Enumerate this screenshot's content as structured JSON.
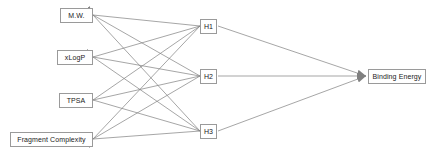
{
  "diagram": {
    "type": "feedforward-neural-network",
    "background_color": "#ffffff",
    "edge_color": "#808080",
    "node_border_color": "#9a9a9a",
    "node_fill_color": "#ffffff",
    "text_color": "#1a1a1a",
    "width": 431,
    "height": 154
  },
  "layers": {
    "input": {
      "name": "input-layer",
      "nodes": [
        {
          "id": "mw",
          "label": "M.W.",
          "x": 60,
          "y": 8,
          "w": 33,
          "h": 15
        },
        {
          "id": "xlogp",
          "label": "xLogP",
          "x": 57,
          "y": 50,
          "w": 36,
          "h": 15
        },
        {
          "id": "tpsa",
          "label": "TPSA",
          "x": 59,
          "y": 93,
          "w": 34,
          "h": 15
        },
        {
          "id": "fragcplx",
          "label": "Fragment Complexity",
          "x": 10,
          "y": 132,
          "w": 83,
          "h": 15
        }
      ]
    },
    "hidden": {
      "name": "hidden-layer",
      "nodes": [
        {
          "id": "h1",
          "label": "H1",
          "x": 200,
          "y": 19,
          "w": 17,
          "h": 15
        },
        {
          "id": "h2",
          "label": "H2",
          "x": 200,
          "y": 69,
          "w": 17,
          "h": 15
        },
        {
          "id": "h3",
          "label": "H3",
          "x": 200,
          "y": 124,
          "w": 17,
          "h": 15
        }
      ]
    },
    "output": {
      "name": "output-layer",
      "nodes": [
        {
          "id": "binding",
          "label": "Binding Energy",
          "x": 368,
          "y": 69,
          "w": 58,
          "h": 15
        }
      ]
    }
  },
  "edges": {
    "input_to_hidden": [
      {
        "from": "mw",
        "to": "h1",
        "x1": 200,
        "y1": 26,
        "x2": 93,
        "y2": 15
      },
      {
        "from": "mw",
        "to": "h2",
        "x1": 200,
        "y1": 76,
        "x2": 93,
        "y2": 15
      },
      {
        "from": "mw",
        "to": "h3",
        "x1": 200,
        "y1": 131,
        "x2": 93,
        "y2": 15
      },
      {
        "from": "xlogp",
        "to": "h1",
        "x1": 200,
        "y1": 26,
        "x2": 93,
        "y2": 57
      },
      {
        "from": "xlogp",
        "to": "h2",
        "x1": 200,
        "y1": 76,
        "x2": 93,
        "y2": 57
      },
      {
        "from": "xlogp",
        "to": "h3",
        "x1": 200,
        "y1": 131,
        "x2": 93,
        "y2": 57
      },
      {
        "from": "tpsa",
        "to": "h1",
        "x1": 200,
        "y1": 26,
        "x2": 93,
        "y2": 100
      },
      {
        "from": "tpsa",
        "to": "h2",
        "x1": 200,
        "y1": 76,
        "x2": 93,
        "y2": 100
      },
      {
        "from": "tpsa",
        "to": "h3",
        "x1": 200,
        "y1": 131,
        "x2": 93,
        "y2": 100
      },
      {
        "from": "fragcplx",
        "to": "h1",
        "x1": 200,
        "y1": 26,
        "x2": 93,
        "y2": 139
      },
      {
        "from": "fragcplx",
        "to": "h2",
        "x1": 200,
        "y1": 76,
        "x2": 93,
        "y2": 139
      },
      {
        "from": "fragcplx",
        "to": "h3",
        "x1": 200,
        "y1": 131,
        "x2": 93,
        "y2": 139
      }
    ],
    "hidden_to_output": [
      {
        "from": "h1",
        "to": "binding",
        "x1": 218,
        "y1": 26,
        "x2": 366,
        "y2": 76
      },
      {
        "from": "h2",
        "to": "binding",
        "x1": 218,
        "y1": 76,
        "x2": 366,
        "y2": 76
      },
      {
        "from": "h3",
        "to": "binding",
        "x1": 218,
        "y1": 131,
        "x2": 366,
        "y2": 76
      }
    ]
  }
}
